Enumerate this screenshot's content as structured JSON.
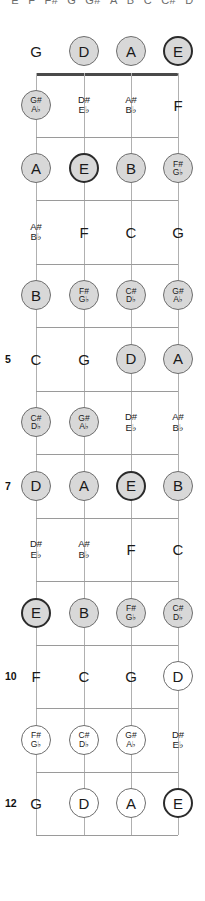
{
  "diagram": {
    "title_strip": {
      "notes": [
        "E",
        "F",
        "F#",
        "G",
        "G#",
        "A",
        "B",
        "C",
        "C#",
        "D"
      ]
    },
    "instrument": "bass-fretboard",
    "strings": [
      "G",
      "D",
      "A",
      "E"
    ],
    "fret_markers": {
      "5": "5",
      "7": "7",
      "10": "10",
      "12": "12"
    },
    "colors": {
      "fill_gray": "#d8d8d8",
      "open_white": "#ffffff",
      "stroke": "#6e6e6e",
      "bold_stroke": "#2b2b2b",
      "nut": "#4a4a4a",
      "fretline": "#9a9a9a",
      "string": "#b0b0b0",
      "text": "#1a1a1a"
    },
    "rows": [
      {
        "fret": "0",
        "marker": "",
        "cells": [
          {
            "label": "G",
            "style": "plain"
          },
          {
            "label": "D",
            "style": "circ-fill"
          },
          {
            "label": "A",
            "style": "circ-fill"
          },
          {
            "label": "E",
            "style": "circ-fill-bold"
          }
        ]
      },
      {
        "fret": "1",
        "marker": "",
        "cells": [
          {
            "sharp": "G#",
            "flat": "A♭",
            "style": "circ-fill"
          },
          {
            "sharp": "D#",
            "flat": "E♭",
            "style": "plain"
          },
          {
            "sharp": "A#",
            "flat": "B♭",
            "style": "plain"
          },
          {
            "label": "F",
            "style": "plain"
          }
        ]
      },
      {
        "fret": "2",
        "marker": "",
        "cells": [
          {
            "label": "A",
            "style": "circ-fill"
          },
          {
            "label": "E",
            "style": "circ-fill-bold"
          },
          {
            "label": "B",
            "style": "circ-fill"
          },
          {
            "sharp": "F#",
            "flat": "G♭",
            "style": "circ-fill"
          }
        ]
      },
      {
        "fret": "3",
        "marker": "",
        "cells": [
          {
            "sharp": "A#",
            "flat": "B♭",
            "style": "plain"
          },
          {
            "label": "F",
            "style": "plain"
          },
          {
            "label": "C",
            "style": "plain"
          },
          {
            "label": "G",
            "style": "plain"
          }
        ]
      },
      {
        "fret": "4",
        "marker": "",
        "cells": [
          {
            "label": "B",
            "style": "circ-fill"
          },
          {
            "sharp": "F#",
            "flat": "G♭",
            "style": "circ-fill"
          },
          {
            "sharp": "C#",
            "flat": "D♭",
            "style": "circ-fill"
          },
          {
            "sharp": "G#",
            "flat": "A♭",
            "style": "circ-fill"
          }
        ]
      },
      {
        "fret": "5",
        "marker": "5",
        "cells": [
          {
            "label": "C",
            "style": "plain"
          },
          {
            "label": "G",
            "style": "plain"
          },
          {
            "label": "D",
            "style": "circ-fill"
          },
          {
            "label": "A",
            "style": "circ-fill"
          }
        ]
      },
      {
        "fret": "6",
        "marker": "",
        "cells": [
          {
            "sharp": "C#",
            "flat": "D♭",
            "style": "circ-fill"
          },
          {
            "sharp": "G#",
            "flat": "A♭",
            "style": "circ-fill"
          },
          {
            "sharp": "D#",
            "flat": "E♭",
            "style": "plain"
          },
          {
            "sharp": "A#",
            "flat": "B♭",
            "style": "plain"
          }
        ]
      },
      {
        "fret": "7",
        "marker": "7",
        "cells": [
          {
            "label": "D",
            "style": "circ-fill"
          },
          {
            "label": "A",
            "style": "circ-fill"
          },
          {
            "label": "E",
            "style": "circ-fill-bold"
          },
          {
            "label": "B",
            "style": "circ-fill"
          }
        ]
      },
      {
        "fret": "8",
        "marker": "",
        "cells": [
          {
            "sharp": "D#",
            "flat": "E♭",
            "style": "plain"
          },
          {
            "sharp": "A#",
            "flat": "B♭",
            "style": "plain"
          },
          {
            "label": "F",
            "style": "plain"
          },
          {
            "label": "C",
            "style": "plain"
          }
        ]
      },
      {
        "fret": "9",
        "marker": "",
        "cells": [
          {
            "label": "E",
            "style": "circ-fill-bold"
          },
          {
            "label": "B",
            "style": "circ-fill"
          },
          {
            "sharp": "F#",
            "flat": "G♭",
            "style": "circ-fill"
          },
          {
            "sharp": "C#",
            "flat": "D♭",
            "style": "circ-fill"
          }
        ]
      },
      {
        "fret": "10",
        "marker": "10",
        "cells": [
          {
            "label": "F",
            "style": "plain"
          },
          {
            "label": "C",
            "style": "plain"
          },
          {
            "label": "G",
            "style": "plain"
          },
          {
            "label": "D",
            "style": "circ-open"
          }
        ]
      },
      {
        "fret": "11",
        "marker": "",
        "cells": [
          {
            "sharp": "F#",
            "flat": "G♭",
            "style": "circ-open"
          },
          {
            "sharp": "C#",
            "flat": "D♭",
            "style": "circ-open"
          },
          {
            "sharp": "G#",
            "flat": "A♭",
            "style": "circ-open"
          },
          {
            "sharp": "D#",
            "flat": "E♭",
            "style": "plain"
          }
        ]
      },
      {
        "fret": "12",
        "marker": "12",
        "cells": [
          {
            "label": "G",
            "style": "plain"
          },
          {
            "label": "D",
            "style": "circ-open"
          },
          {
            "label": "A",
            "style": "circ-open"
          },
          {
            "label": "E",
            "style": "circ-open-bold"
          }
        ]
      }
    ]
  }
}
